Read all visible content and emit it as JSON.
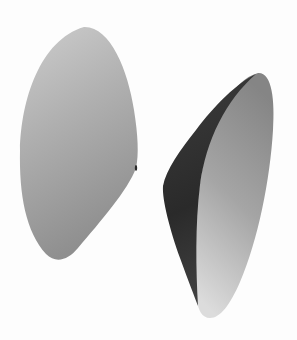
{
  "scene": {
    "description": "Two grayscale rendered 3D curved surface patches on a white background",
    "background_color": "#fdfdfd",
    "objects": [
      {
        "id": "left-surface",
        "shape": "teardrop / rounded triangular surface",
        "colors": {
          "top_highlight": "#c9c9c9",
          "mid": "#a9a9a9",
          "shadow_bottom": "#8e8e8e"
        }
      },
      {
        "id": "right-surface",
        "shape": "curved cone-like shell showing inner dark face",
        "colors": {
          "outer_top": "#8a8a8a",
          "outer_bottom_highlight": "#d6d6d6",
          "inner_dark_face": "#3a3a3a",
          "inner_dark_face_deep": "#262626"
        }
      }
    ]
  }
}
